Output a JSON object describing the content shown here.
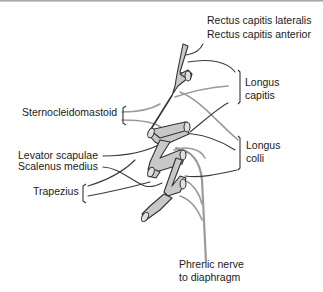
{
  "diagram": {
    "labels": {
      "rectus_lat": "Rectus capitis lateralis",
      "rectus_ant": "Rectus capitis anterior",
      "longus_capitis_1": "Longus",
      "longus_capitis_2": "capitis",
      "sternocleidomastoid": "Sternocleidomastoid",
      "longus_colli_1": "Longus",
      "longus_colli_2": "colli",
      "levator": "Levator scapulae",
      "scalenus": "Scalenus medius",
      "trapezius": "Trapezius",
      "phrenic_1": "Phrenic nerve",
      "phrenic_2": "to diaphragm"
    },
    "colors": {
      "nerve_fill": "#c8c8c8",
      "outline": "#333333",
      "gray_branch": "#9a9a9a",
      "dark_branch": "#4a4a4a"
    }
  }
}
